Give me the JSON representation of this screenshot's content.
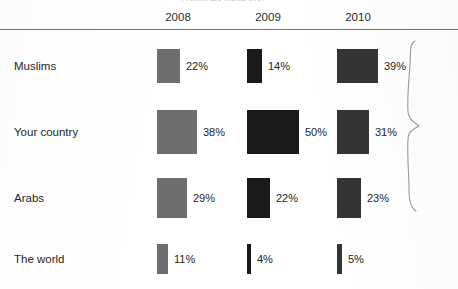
{
  "title": "countries have you ...",
  "columns": [
    "2008",
    "2009",
    "2010"
  ],
  "rows": [
    {
      "label": "Muslims"
    },
    {
      "label": "Your country"
    },
    {
      "label": "Arabs"
    },
    {
      "label": "The world"
    }
  ],
  "values": {
    "r0c0": "22%",
    "r0c1": "14%",
    "r0c2": "39%",
    "r1c0": "38%",
    "r1c1": "50%",
    "r1c2": "31%",
    "r2c0": "29%",
    "r2c1": "22%",
    "r2c2": "23%",
    "r3c0": "11%",
    "r3c1": "4%",
    "r3c2": "5%"
  },
  "colors": {
    "2008": "#6e6e6e",
    "2009": "#1a1a1a",
    "2010": "#343434",
    "rule": "#6f6f6f",
    "text": "#1f1f1f",
    "brace": "#9a9a9a",
    "background": "#ffffff"
  },
  "annotations": {
    "brace": "curly-brace grouping Muslims, Your country and Arabs rows"
  },
  "chart_data": {
    "type": "bar",
    "title": "countries have you ...",
    "orientation": "horizontal",
    "value_unit": "percent",
    "xlabel": "",
    "ylabel": "",
    "xlim": [
      0,
      50
    ],
    "grid": false,
    "legend_position": "top (column headers)",
    "categories": [
      "Muslims",
      "Your country",
      "Arabs",
      "The world"
    ],
    "series": [
      {
        "name": "2008",
        "color": "#6e6e6e",
        "values": [
          22,
          38,
          29,
          11
        ]
      },
      {
        "name": "2009",
        "color": "#1a1a1a",
        "values": [
          14,
          50,
          22,
          4
        ]
      },
      {
        "name": "2010",
        "color": "#343434",
        "values": [
          39,
          31,
          23,
          5
        ]
      }
    ],
    "data_labels": [
      [
        "22%",
        "14%",
        "39%"
      ],
      [
        "38%",
        "50%",
        "31%"
      ],
      [
        "29%",
        "22%",
        "23%"
      ],
      [
        "11%",
        "4%",
        "5%"
      ]
    ],
    "annotations": [
      "hand-drawn curly brace spanning the first three category rows"
    ]
  }
}
